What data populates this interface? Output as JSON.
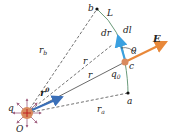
{
  "labels": {
    "b": "b",
    "L": "L",
    "rb": "r",
    "rb_sub": "b",
    "dr": "dr",
    "dl": "dl",
    "E": "E",
    "theta": "θ",
    "r_prime": "r",
    "r": "r",
    "c": "c",
    "q0": "q",
    "q0_sub": "0",
    "r0": "r",
    "r0_sup": "0",
    "q": "q",
    "O": "O",
    "a": "a",
    "ra": "r",
    "ra_sub": "a"
  },
  "colors": {
    "E_arrow": "#e8883a",
    "dl_arrow": "#3aa0e0",
    "r0_arrow": "#3a6fb8",
    "charge": "#d98a5e",
    "path": "#6a9a7a",
    "field_lines": "#a06080",
    "dashed": "#333333"
  }
}
